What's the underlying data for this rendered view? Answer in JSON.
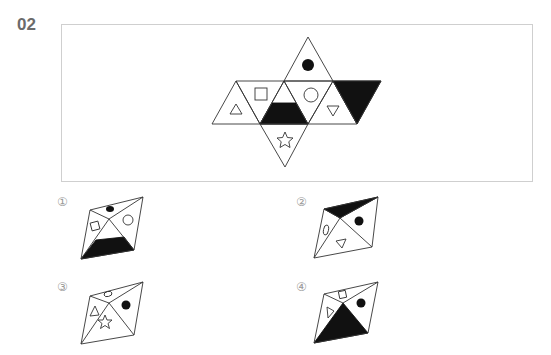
{
  "question": {
    "number": "02",
    "net_description": "Unfolded octahedron net with 8 triangular faces",
    "net_faces": [
      {
        "position": "top",
        "symbol": "filled-circle"
      },
      {
        "position": "row-1-up",
        "symbol": "outline-triangle"
      },
      {
        "position": "row-2-down",
        "symbol": "outline-square"
      },
      {
        "position": "row-3-up",
        "symbol": "filled-trapezoid-bottom"
      },
      {
        "position": "row-4-down",
        "symbol": "outline-circle"
      },
      {
        "position": "row-5-up",
        "symbol": "outline-inverted-triangle"
      },
      {
        "position": "row-6-down",
        "symbol": "filled-full"
      },
      {
        "position": "bottom",
        "symbol": "outline-star"
      }
    ]
  },
  "options": [
    {
      "label": "①",
      "faces": [
        "filled-ellipse-top",
        "outline-square-left",
        "outline-circle-right",
        "filled-trapezoid-bottom"
      ]
    },
    {
      "label": "②",
      "faces": [
        "filled-full-top",
        "outline-ellipse-left",
        "filled-circle-right",
        "outline-inverted-triangle-bottom"
      ]
    },
    {
      "label": "③",
      "faces": [
        "outline-ellipse-top",
        "outline-triangle-left",
        "filled-circle-right",
        "outline-star-bottom"
      ]
    },
    {
      "label": "④",
      "faces": [
        "outline-square-top",
        "outline-triangle-left",
        "filled-circle-right",
        "filled-full-bottom"
      ]
    }
  ],
  "colors": {
    "stroke": "#333333",
    "fill": "#111111",
    "box_border": "#cfcfcf",
    "number": "#6b6b6b"
  }
}
